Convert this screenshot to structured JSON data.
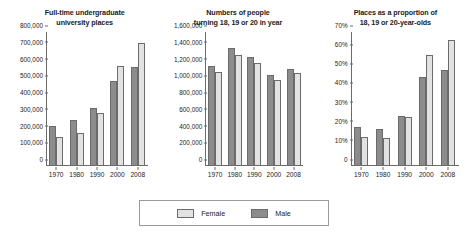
{
  "legend": {
    "position": "bottom-center",
    "entries": [
      {
        "label": "Female",
        "color": "#e2e2e2"
      },
      {
        "label": "Male",
        "color": "#8c8c8c"
      }
    ]
  },
  "colors": {
    "female": "#e2e2e2",
    "male": "#8c8c8c",
    "axis": "#6b6b6b"
  },
  "chart_data": [
    {
      "type": "bar",
      "title": "Full-time undergraduate university places",
      "title_lines": [
        "Full-time undergraduate",
        "university places"
      ],
      "xlabel": "",
      "ylabel": "",
      "categories": [
        "1970",
        "1980",
        "1990",
        "2000",
        "2008"
      ],
      "ylim": [
        0,
        800000
      ],
      "ytick_step": 100000,
      "yticks": [
        "0",
        "100,000",
        "200,000",
        "300,000",
        "400,000",
        "500,000",
        "600,000",
        "700,000",
        "800,000"
      ],
      "grid": false,
      "series": [
        {
          "name": "Male",
          "values": [
            240000,
            277000,
            347000,
            510000,
            592000
          ]
        },
        {
          "name": "Female",
          "values": [
            172000,
            196000,
            317000,
            600000,
            735000
          ]
        }
      ]
    },
    {
      "type": "bar",
      "title": "Numbers of people turning 18, 19 or 20 in year",
      "title_lines": [
        "Numbers of people",
        "turning 18, 19 or 20 in year"
      ],
      "xlabel": "",
      "ylabel": "",
      "categories": [
        "1970",
        "1980",
        "1990",
        "2000",
        "2008"
      ],
      "ylim": [
        0,
        1600000
      ],
      "ytick_step": 200000,
      "yticks": [
        "0",
        "200,000",
        "400,000",
        "600,000",
        "800,000",
        "1,000,000",
        "1,200,000",
        "1,400,000",
        "1,600,000"
      ],
      "grid": false,
      "series": [
        {
          "name": "Male",
          "values": [
            1190000,
            1405000,
            1302000,
            1085000,
            1163000
          ]
        },
        {
          "name": "Female",
          "values": [
            1120000,
            1322000,
            1232000,
            1022000,
            1105000
          ]
        }
      ]
    },
    {
      "type": "bar",
      "title": "Places as a proportion of 18, 19 or 20-year-olds",
      "title_lines": [
        "Places as a proportion of",
        "18, 19 or 20-year-olds"
      ],
      "xlabel": "",
      "ylabel": "",
      "categories": [
        "1970",
        "1980",
        "1990",
        "2000",
        "2008"
      ],
      "ylim": [
        0,
        70
      ],
      "ytick_step": 10,
      "yticks": [
        "0",
        "10%",
        "20%",
        "30%",
        "40%",
        "50%",
        "60%",
        "70%"
      ],
      "grid": false,
      "series": [
        {
          "name": "Male",
          "values": [
            20.2,
            19.4,
            26.2,
            46.6,
            50.3
          ]
        },
        {
          "name": "Female",
          "values": [
            15.2,
            14.4,
            25.8,
            57.8,
            65.8
          ]
        }
      ]
    }
  ]
}
